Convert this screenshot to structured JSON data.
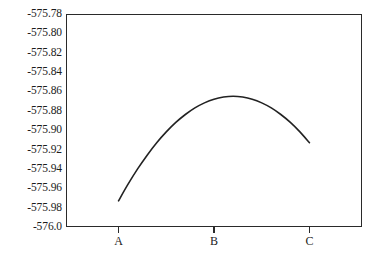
{
  "chart_data": {
    "type": "line",
    "title": "",
    "subtitle": "",
    "xlabel": "",
    "ylabel": "",
    "grid": false,
    "legend": false,
    "legend_position": "none",
    "line_color": "#222222",
    "frame_color": "#2a2a2a",
    "background": "#ffffff",
    "x_tick_labels": [
      "A",
      "B",
      "C"
    ],
    "x_tick_positions": [
      1,
      2,
      3
    ],
    "xlim": [
      0.45,
      3.55
    ],
    "y_tick_labels": [
      "-575.78",
      "-575.80",
      "-575.82",
      "-575.84",
      "-575.86",
      "-575.88",
      "-575.90",
      "-575.92",
      "-575.94",
      "-575.96",
      "-575.98",
      "-576.0"
    ],
    "y_tick_values": [
      -575.78,
      -575.8,
      -575.82,
      -575.84,
      -575.86,
      -575.88,
      -575.9,
      -575.92,
      -575.94,
      -575.96,
      -575.98,
      -576.0
    ],
    "ylim": [
      -576.0,
      -575.78
    ],
    "series": [
      {
        "name": "curve",
        "x": [
          1.0,
          1.1,
          1.2,
          1.3,
          1.4,
          1.5,
          1.6,
          1.7,
          1.8,
          1.9,
          2.0,
          2.1,
          2.2,
          2.3,
          2.4,
          2.5,
          2.6,
          2.7,
          2.8,
          2.9,
          3.0
        ],
        "values": [
          -575.973,
          -575.9558,
          -575.94,
          -575.9258,
          -575.913,
          -575.9018,
          -575.892,
          -575.8838,
          -575.877,
          -575.8718,
          -575.868,
          -575.8658,
          -575.865,
          -575.8658,
          -575.868,
          -575.8718,
          -575.877,
          -575.8838,
          -575.892,
          -575.9018,
          -575.913
        ]
      }
    ],
    "vertex": {
      "x_label": "B",
      "x": 2.0,
      "y": -575.801
    },
    "endpoints": [
      {
        "x_label": "A",
        "x": 1.0,
        "y": -575.973
      },
      {
        "x_label": "C",
        "x": 3.0,
        "y": -575.973
      }
    ],
    "curve_path": "M 73,188 C 95,150 117,84 149,21 C 160,0 164,0 175,21 C 207,84 229,150 251,188"
  },
  "figure": {
    "caption_sliver": ""
  }
}
